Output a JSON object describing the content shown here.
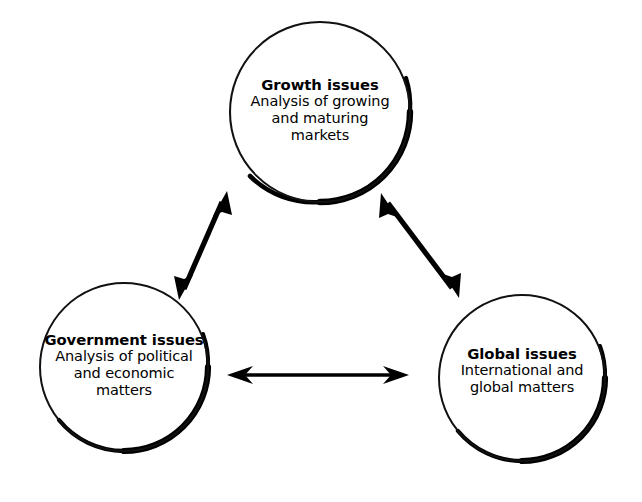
{
  "diagram": {
    "type": "venn-triad-relationship",
    "background_color": "#ffffff",
    "stroke_color": "#000000",
    "nodes": [
      {
        "id": "growth",
        "title": "Growth issues",
        "lines": [
          "Analysis of growing",
          "and maturing",
          "markets"
        ],
        "center_x": 320,
        "center_y": 112,
        "radius": 90
      },
      {
        "id": "government",
        "title": "Government issues",
        "lines": [
          "Analysis of political",
          "and economic",
          "matters"
        ],
        "center_x": 124,
        "center_y": 367,
        "radius": 84
      },
      {
        "id": "global",
        "title": "Global issues",
        "lines": [
          "International and",
          "global matters"
        ],
        "center_x": 522,
        "center_y": 378,
        "radius": 83
      }
    ],
    "connectors": [
      {
        "id": "growth-government",
        "from": "growth",
        "to": "government",
        "style": "double-headed-arrow",
        "orientation": "diagonal"
      },
      {
        "id": "growth-global",
        "from": "growth",
        "to": "global",
        "style": "double-headed-arrow",
        "orientation": "diagonal"
      },
      {
        "id": "government-global",
        "from": "government",
        "to": "global",
        "style": "double-headed-arrow",
        "orientation": "horizontal"
      }
    ]
  }
}
